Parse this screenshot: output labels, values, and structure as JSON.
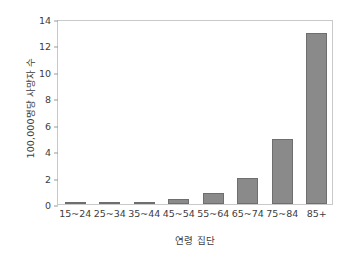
{
  "chart_data": {
    "type": "bar",
    "title": "",
    "subtitle": "",
    "xlabel": "연령 집단",
    "ylabel": "100,000명당 사망자 수",
    "categories": [
      "15~24",
      "25~34",
      "35~44",
      "45~54",
      "55~64",
      "65~74",
      "75~84",
      "85+"
    ],
    "values": [
      0.08,
      0.1,
      0.18,
      0.38,
      0.85,
      1.95,
      4.95,
      12.95
    ],
    "yticks": [
      0,
      2,
      4,
      6,
      8,
      10,
      12,
      14
    ],
    "ytick_labels": [
      "0",
      "2",
      "4",
      "6",
      "8",
      "10",
      "12",
      "14"
    ],
    "ylim": [
      0,
      14
    ],
    "xlim_categories": 8,
    "grid": false,
    "legend": false,
    "legend_position": "none",
    "bar_color": "#8a8a8a",
    "bar_edge_color": "#6e6e6e",
    "frame_color": "#c9c9c9",
    "background_color": "#ffffff",
    "text_color": "#3d3d3d",
    "annotations": []
  }
}
